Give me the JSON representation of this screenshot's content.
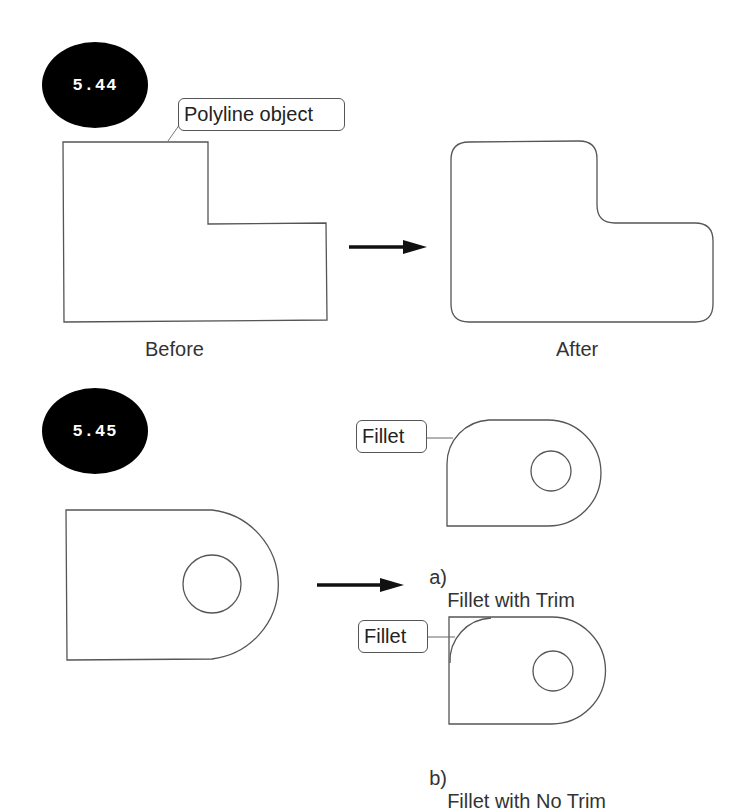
{
  "figures": [
    {
      "number": "5.44",
      "callout": "Polyline object",
      "before_label": "Before",
      "after_label": "After"
    },
    {
      "number": "5.45",
      "callouts": [
        "Fillet",
        "Fillet"
      ],
      "captions": [
        {
          "marker": "a)",
          "text": "Fillet with Trim"
        },
        {
          "marker": "b)",
          "text": "Fillet with No Trim"
        }
      ]
    }
  ],
  "colors": {
    "stroke": "#555555",
    "badge_bg": "#000000",
    "badge_text": "#ffffff",
    "arrow": "#111111"
  }
}
